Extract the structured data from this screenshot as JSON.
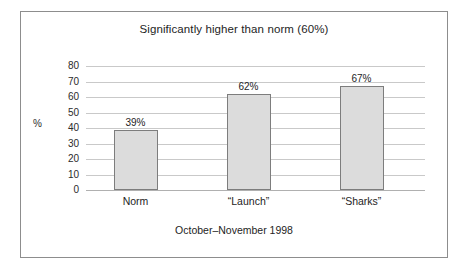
{
  "figure": {
    "frame_color": "#8d8d8d",
    "background": "#ffffff"
  },
  "chart_data": {
    "type": "bar",
    "title": "Significantly higher than norm (60%)",
    "subtitle": "October–November 1998",
    "xlabel": "",
    "ylabel": "%",
    "categories": [
      "Norm",
      "“Launch”",
      "“Sharks”"
    ],
    "values": [
      39,
      62,
      67
    ],
    "value_labels": [
      "39%",
      "62%",
      "67%"
    ],
    "ylim": [
      0,
      80
    ],
    "ytick_labels": [
      "80",
      "70",
      "60",
      "50",
      "40",
      "30",
      "20",
      "10",
      "0"
    ],
    "ytick_values": [
      80,
      70,
      60,
      50,
      40,
      30,
      20,
      10,
      0
    ],
    "grid": true,
    "legend": false,
    "bar_fill_color": "#dcdcdc",
    "bar_border_color": "#7d7d7d",
    "gridline_color": "#c9c9c9",
    "axis_color": "#b0b0b0"
  }
}
